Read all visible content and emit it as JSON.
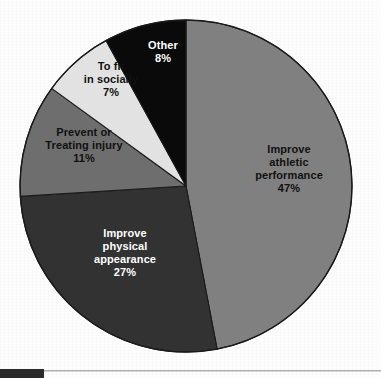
{
  "figure": {
    "background_color": "#fdfdfd",
    "outline_color": "#1a1a1a",
    "rule_color": "#9a9a9a",
    "block_color": "#2b2b2b"
  },
  "chart_data": {
    "type": "pie",
    "title": "",
    "subtitle": "",
    "xlabel": "",
    "ylabel": "",
    "legend_position": "none",
    "grid": false,
    "start_angle_deg": 0,
    "direction": "clockwise",
    "total_percent": 100,
    "categories": [
      "Improve athletic performance",
      "Improve physical appearance",
      "Prevent or Treating injury",
      "To fit in socially",
      "Other"
    ],
    "values": [
      47,
      27,
      11,
      7,
      8
    ],
    "value_labels": [
      "47%",
      "27%",
      "11%",
      "7%",
      "8%"
    ],
    "colors": [
      "#808080",
      "#323232",
      "#6e6e6e",
      "#e2e2e2",
      "#0a0a0a"
    ],
    "slices": [
      {
        "name": "improve-athletic-performance",
        "label_lines": [
          "Improve",
          "athletic",
          "performance"
        ],
        "percent_label": "47%",
        "value": 47,
        "color": "#808080",
        "text_color": "#111111",
        "label_x": 289,
        "label_y": 172
      },
      {
        "name": "improve-physical-appearance",
        "label_lines": [
          "Improve",
          "physical",
          "appearance"
        ],
        "percent_label": "27%",
        "value": 27,
        "color": "#323232",
        "text_color": "#ffffff",
        "label_x": 125,
        "label_y": 256
      },
      {
        "name": "prevent-or-treating-injury",
        "label_lines": [
          "Prevent or",
          "Treating injury"
        ],
        "percent_label": "11%",
        "value": 11,
        "color": "#6e6e6e",
        "text_color": "#111111",
        "label_x": 84,
        "label_y": 149
      },
      {
        "name": "to-fit-in-socially",
        "label_lines": [
          "To fit",
          "in socially"
        ],
        "percent_label": "7%",
        "value": 7,
        "color": "#e2e2e2",
        "text_color": "#111111",
        "label_x": 111,
        "label_y": 83
      },
      {
        "name": "other",
        "label_lines": [
          "Other"
        ],
        "percent_label": "8%",
        "value": 8,
        "color": "#0a0a0a",
        "text_color": "#ffffff",
        "label_x": 163,
        "label_y": 55
      }
    ],
    "geometry": {
      "center_x": 186,
      "center_y": 186,
      "radius": 166
    }
  }
}
